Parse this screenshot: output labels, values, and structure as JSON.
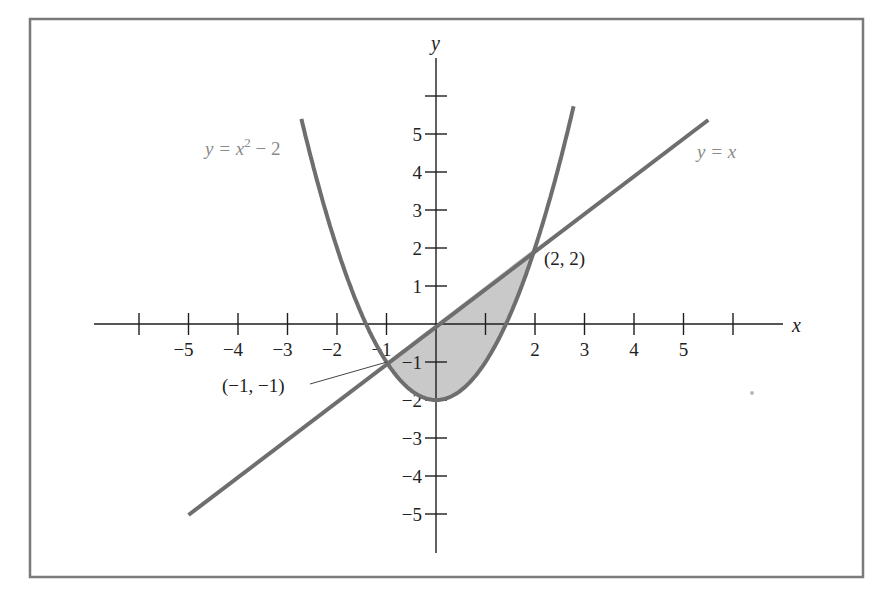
{
  "chart_data": {
    "type": "line",
    "title": "",
    "xlabel": "x",
    "ylabel": "y",
    "xlim": [
      -6,
      6
    ],
    "ylim": [
      -6,
      6
    ],
    "grid": false,
    "x_ticks": [
      -5,
      -4,
      -3,
      -2,
      -1,
      1,
      2,
      3,
      4,
      5
    ],
    "y_ticks": [
      -5,
      -4,
      -3,
      -2,
      -1,
      1,
      2,
      3,
      4,
      5
    ],
    "series": [
      {
        "name": "y = x^2 - 2",
        "function": "x^2 - 2",
        "color": "#6e6e6e"
      },
      {
        "name": "y = x",
        "function": "x",
        "color": "#6e6e6e"
      }
    ],
    "shaded_region": {
      "between": [
        "y = x",
        "y = x^2 - 2"
      ],
      "x_range": [
        -1,
        2
      ],
      "color": "#c9c9c9"
    },
    "annotations": [
      {
        "text": "(-1, -1)",
        "x": -1,
        "y": -1
      },
      {
        "text": "(2, 2)",
        "x": 2,
        "y": 2
      }
    ]
  },
  "labels": {
    "x_axis": "x",
    "y_axis": "y",
    "parabola": {
      "prefix": "y = x",
      "exp": "2",
      "suffix": " − 2"
    },
    "line": "y = x",
    "point_a": "(−1, −1)",
    "point_b": "(2, 2)"
  },
  "ticks": {
    "x": [
      {
        "label": "−5",
        "v": -5
      },
      {
        "label": "−4",
        "v": -4
      },
      {
        "label": "−3",
        "v": -3
      },
      {
        "label": "−2",
        "v": -2
      },
      {
        "label": "−1",
        "v": -1
      },
      {
        "label": "2",
        "v": 2
      },
      {
        "label": "3",
        "v": 3
      },
      {
        "label": "4",
        "v": 4
      },
      {
        "label": "5",
        "v": 5
      }
    ],
    "y": [
      {
        "label": "5",
        "v": 5
      },
      {
        "label": "4",
        "v": 4
      },
      {
        "label": "3",
        "v": 3
      },
      {
        "label": "2",
        "v": 2
      },
      {
        "label": "1",
        "v": 1
      },
      {
        "label": "−1",
        "v": -1
      },
      {
        "label": "−2",
        "v": -2
      },
      {
        "label": "−3",
        "v": -3
      },
      {
        "label": "−4",
        "v": -4
      },
      {
        "label": "−5",
        "v": -5
      }
    ]
  },
  "colors": {
    "curve": "#6e6e6e",
    "shade": "#c9c9c9",
    "frame": "#7a7a7a",
    "axis": "#1e1e1e",
    "equation_text": "#8a8a8a"
  }
}
